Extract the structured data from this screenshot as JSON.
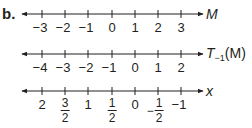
{
  "part_label": "b.",
  "number_lines": [
    {
      "name": "M",
      "ticks": [
        "−3",
        "−2",
        "−1",
        "0",
        "1",
        "2",
        "3"
      ]
    },
    {
      "name_main": "T",
      "name_sub": "−1",
      "name_arg": "(M)",
      "ticks": [
        "−4",
        "−3",
        "−2",
        "−1",
        "0",
        "1",
        "2"
      ]
    },
    {
      "name": "x",
      "ticks": [
        {
          "type": "int",
          "text": "2"
        },
        {
          "type": "frac",
          "num": "3",
          "den": "2"
        },
        {
          "type": "int",
          "text": "1"
        },
        {
          "type": "frac",
          "num": "1",
          "den": "2"
        },
        {
          "type": "int",
          "text": "0"
        },
        {
          "type": "negfrac",
          "sign": "−",
          "num": "1",
          "den": "2"
        },
        {
          "type": "int",
          "text": "−1"
        }
      ]
    }
  ],
  "colors": {
    "ink": "#231f20"
  }
}
